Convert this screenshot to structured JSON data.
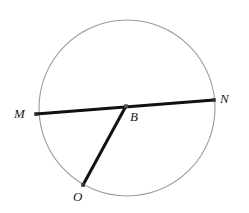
{
  "figure": {
    "type": "geometry-diagram",
    "background_color": "#ffffff",
    "width": 249,
    "height": 213
  },
  "circle": {
    "name": "circle",
    "center_x": 127,
    "center_y": 108,
    "radius": 88,
    "stroke_color": "#9a9a9a",
    "stroke_width": 1.1,
    "fill": "none"
  },
  "points": [
    {
      "id": "M",
      "label": "M",
      "x": 36,
      "y": 114,
      "marker_color": "#333333",
      "marker_size": 3.6,
      "label_x": 14,
      "label_y": 107,
      "on_circle": true
    },
    {
      "id": "B",
      "label": "B",
      "x": 126,
      "y": 106,
      "marker_color": "#555555",
      "marker_size": 3.6,
      "label_x": 130,
      "label_y": 110,
      "on_circle": false
    },
    {
      "id": "N",
      "label": "N",
      "x": 214,
      "y": 100,
      "marker_color": "#333333",
      "marker_size": 3.6,
      "label_x": 220,
      "label_y": 92,
      "on_circle": true
    },
    {
      "id": "O",
      "label": "O",
      "x": 83,
      "y": 185,
      "marker_color": "#333333",
      "marker_size": 3.6,
      "label_x": 73,
      "label_y": 190,
      "on_circle": true
    }
  ],
  "segments": [
    {
      "id": "MN",
      "name": "chord-m-n",
      "from": "M",
      "to": "N",
      "x1": 36,
      "y1": 114,
      "x2": 214,
      "y2": 100,
      "stroke_color": "#111111",
      "stroke_width": 3.0,
      "kind": "chord"
    },
    {
      "id": "BO",
      "name": "radius-b-o",
      "from": "B",
      "to": "O",
      "x1": 126,
      "y1": 106,
      "x2": 83,
      "y2": 185,
      "stroke_color": "#111111",
      "stroke_width": 3.0,
      "kind": "radius"
    }
  ]
}
